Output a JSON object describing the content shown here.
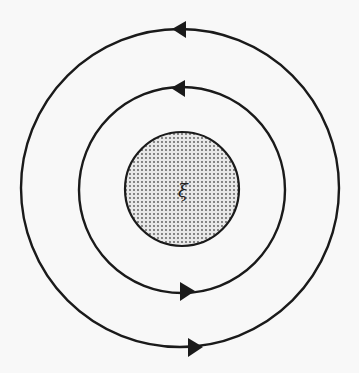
{
  "diagram": {
    "center_label": "ξ",
    "colors": {
      "background": "#f8f8f8",
      "stroke": "#1a1a1a",
      "dot_fill": "#555555",
      "disc_bg": "#e6e6e6"
    },
    "loops": [
      {
        "name": "outer-loop",
        "cx": 180,
        "cy": 188,
        "r": 159,
        "arrows": [
          "top-left-pointing",
          "bottom-right-pointing"
        ]
      },
      {
        "name": "inner-loop",
        "cx": 182,
        "cy": 190,
        "r": 103,
        "arrows": [
          "top-left-pointing",
          "bottom-right-pointing"
        ]
      }
    ],
    "disc": {
      "cx": 182,
      "cy": 189,
      "r": 57
    }
  }
}
